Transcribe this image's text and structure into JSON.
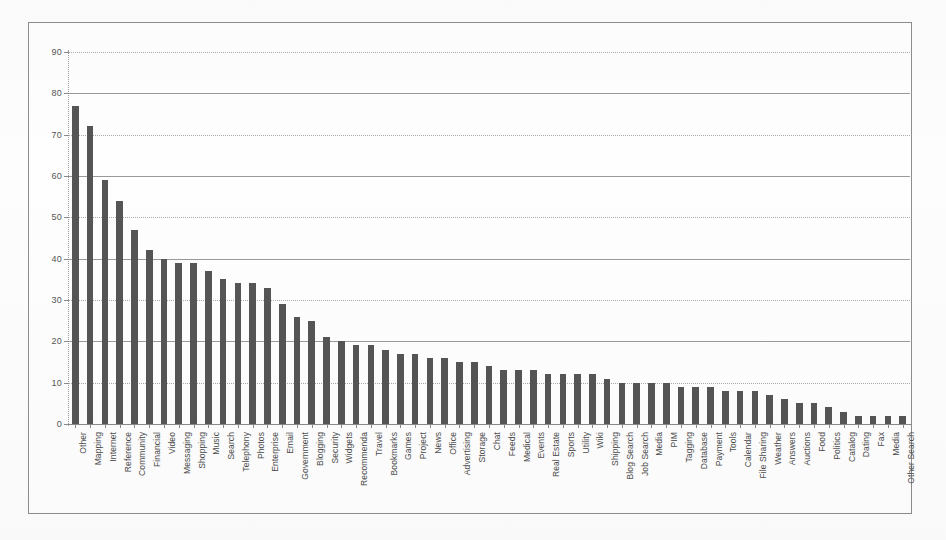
{
  "chart_data": {
    "type": "bar",
    "title": "",
    "xlabel": "",
    "ylabel": "",
    "ylim": [
      0,
      90
    ],
    "y_ticks": [
      0,
      10,
      20,
      30,
      40,
      50,
      60,
      70,
      80,
      90
    ],
    "grid": true,
    "legend": "none",
    "bar_color": "#555555",
    "categories": [
      "Other",
      "Mapping",
      "Internet",
      "Reference",
      "Community",
      "Financial",
      "Video",
      "Messaging",
      "Shopping",
      "Music",
      "Search",
      "Telephony",
      "Photos",
      "Enterprise",
      "Email",
      "Government",
      "Blogging",
      "Security",
      "Widgets",
      "Recommenda",
      "Travel",
      "Bookmarks",
      "Games",
      "Project",
      "News",
      "Office",
      "Advertising",
      "Storage",
      "Chat",
      "Feeds",
      "Medical",
      "Events",
      "Real Estate",
      "Sports",
      "Utility",
      "Wiki",
      "Shipping",
      "Blog Search",
      "Job Search",
      "Media",
      "PIM",
      "Tagging",
      "Database",
      "Payment",
      "Tools",
      "Calendar",
      "File Sharing",
      "Weather",
      "Answers",
      "Auctions",
      "Food",
      "Politics",
      "Catalog",
      "Dating",
      "Fax",
      "Media",
      "Other Search"
    ],
    "values": [
      77,
      72,
      59,
      54,
      47,
      42,
      40,
      39,
      39,
      37,
      35,
      34,
      34,
      33,
      29,
      26,
      25,
      21,
      20,
      19,
      19,
      18,
      17,
      17,
      16,
      16,
      15,
      15,
      14,
      13,
      13,
      13,
      12,
      12,
      12,
      12,
      11,
      10,
      10,
      10,
      10,
      9,
      9,
      9,
      8,
      8,
      8,
      7,
      6,
      5,
      5,
      4,
      3,
      2,
      2,
      2,
      2
    ]
  }
}
